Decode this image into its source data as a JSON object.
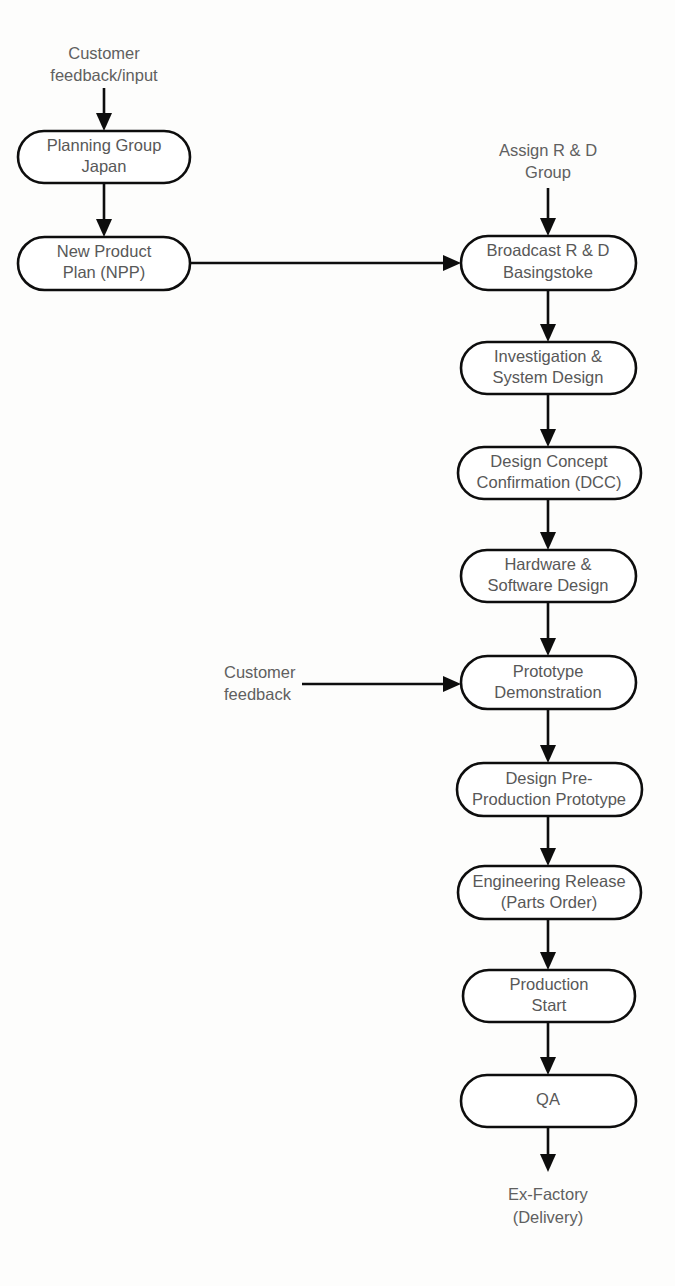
{
  "diagram": {
    "background_color": "#fdfdfc",
    "node_fill": "#ffffff",
    "node_stroke": "#0d0d0d",
    "text_color": "#585858",
    "label_color": "#606060"
  },
  "free_labels": [
    {
      "id": "customer-feedback-input",
      "lines": [
        "Customer",
        "feedback/input"
      ],
      "line1": "Customer",
      "line2": "feedback/input"
    },
    {
      "id": "assign-rd-group",
      "lines": [
        "Assign R & D",
        "Group"
      ],
      "line1": "Assign R & D",
      "line2": "Group"
    },
    {
      "id": "customer-feedback",
      "lines": [
        "Customer",
        "feedback"
      ],
      "line1": "Customer",
      "line2": "feedback"
    },
    {
      "id": "ex-factory",
      "lines": [
        "Ex-Factory",
        "(Delivery)"
      ],
      "line1": "Ex-Factory",
      "line2": "(Delivery)"
    }
  ],
  "nodes": [
    {
      "id": "planning-group-japan",
      "line1": "Planning Group",
      "line2": "Japan"
    },
    {
      "id": "new-product-plan",
      "line1": "New Product",
      "line2": "Plan (NPP)"
    },
    {
      "id": "broadcast-rd-basingstoke",
      "line1": "Broadcast R & D",
      "line2": "Basingstoke"
    },
    {
      "id": "investigation-system-design",
      "line1": "Investigation &",
      "line2": "System Design"
    },
    {
      "id": "design-concept-confirmation",
      "line1": "Design Concept",
      "line2": "Confirmation (DCC)"
    },
    {
      "id": "hardware-software-design",
      "line1": "Hardware &",
      "line2": "Software Design"
    },
    {
      "id": "prototype-demonstration",
      "line1": "Prototype",
      "line2": "Demonstration"
    },
    {
      "id": "design-pre-production-prototype",
      "line1": "Design Pre-",
      "line2": "Production Prototype"
    },
    {
      "id": "engineering-release",
      "line1": "Engineering Release",
      "line2": "(Parts Order)"
    },
    {
      "id": "production-start",
      "line1": "Production",
      "line2": "Start"
    },
    {
      "id": "qa",
      "line1": "QA",
      "line2": ""
    }
  ]
}
